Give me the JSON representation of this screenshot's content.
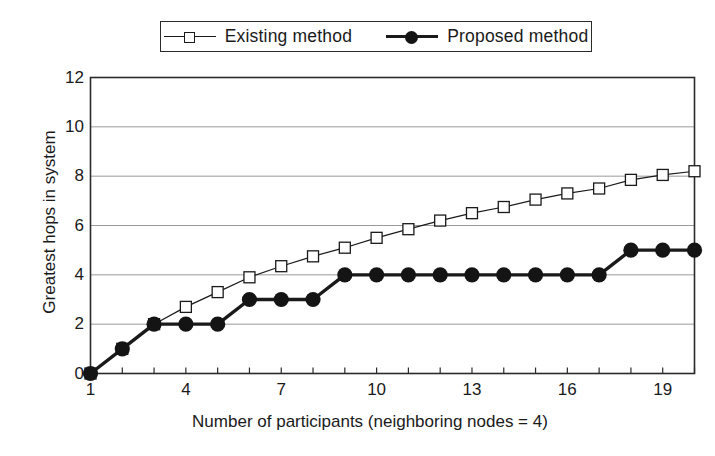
{
  "legend": {
    "position": "top-center",
    "entries": [
      {
        "label": "Existing method",
        "marker": "open-square",
        "marker_icon": "square-outline-icon"
      },
      {
        "label": "Proposed method",
        "marker": "filled-circle",
        "marker_icon": "circle-filled-icon"
      }
    ]
  },
  "colors": {
    "line": "#1a1a1a",
    "grid": "#9a9a9a",
    "frame": "#2b2b2b",
    "background": "#ffffff",
    "marker_fill_open": "#ffffff",
    "marker_fill_solid": "#141414"
  },
  "chart_data": {
    "type": "line",
    "title": "",
    "xlabel": "Number of participants (neighboring nodes = 4)",
    "ylabel": "Greatest hops in system",
    "xlim": [
      1,
      20
    ],
    "ylim": [
      0,
      12
    ],
    "grid": true,
    "xticks": [
      1,
      2,
      3,
      4,
      5,
      6,
      7,
      8,
      9,
      10,
      11,
      12,
      13,
      14,
      15,
      16,
      17,
      18,
      19,
      20
    ],
    "xtick_labels": [
      "1",
      "4",
      "7",
      "10",
      "13",
      "16",
      "19"
    ],
    "xtick_label_values": [
      1,
      4,
      7,
      10,
      13,
      16,
      19
    ],
    "yticks": [
      0,
      2,
      4,
      6,
      8,
      10,
      12
    ],
    "ytick_labels": [
      "0",
      "2",
      "4",
      "6",
      "8",
      "10",
      "12"
    ],
    "x": [
      1,
      2,
      3,
      4,
      5,
      6,
      7,
      8,
      9,
      10,
      11,
      12,
      13,
      14,
      15,
      16,
      17,
      18,
      19,
      20
    ],
    "series": [
      {
        "name": "Existing method",
        "marker": "open-square",
        "values": [
          0,
          1,
          2,
          2.7,
          3.3,
          3.9,
          4.35,
          4.75,
          5.1,
          5.5,
          5.85,
          6.2,
          6.5,
          6.75,
          7.05,
          7.3,
          7.5,
          7.85,
          8.05,
          8.2
        ]
      },
      {
        "name": "Proposed method",
        "marker": "filled-circle",
        "values": [
          0,
          1,
          2,
          2,
          2,
          3,
          3,
          3,
          4,
          4,
          4,
          4,
          4,
          4,
          4,
          4,
          4,
          5,
          5,
          5
        ]
      }
    ]
  }
}
